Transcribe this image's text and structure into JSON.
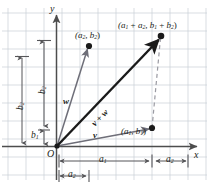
{
  "figure": {
    "type": "vector-addition-diagram",
    "axes": {
      "x_label": "x",
      "y_label": "y",
      "origin_label": "O"
    },
    "colors": {
      "grid": "#c9cfd6",
      "axis": "#4d4d4d",
      "vector_v": "#6e6e78",
      "vector_w": "#6e6e78",
      "vector_sum": "#1a1a1a",
      "dashed": "#9a9aa2",
      "measure": "#555558",
      "text": "#231f20",
      "background": "#ffffff"
    },
    "points": [
      {
        "name": "point-v",
        "label_a": "a",
        "label_a_sub": "1",
        "label_b": "b",
        "label_b_sub": "1",
        "text": "(a1, b1)"
      },
      {
        "name": "point-w",
        "label_a": "a",
        "label_a_sub": "2",
        "label_b": "b",
        "label_b_sub": "2",
        "text": "(a2, b2)"
      },
      {
        "name": "point-sum",
        "text": "(a1 + a2, b1 + b2)"
      }
    ],
    "labels": {
      "point_v": {
        "open": "(",
        "a": "a",
        "a_sub": "1",
        "comma": ", ",
        "b": "b",
        "b_sub": "1",
        "close": ")"
      },
      "point_w": {
        "open": "(",
        "a": "a",
        "a_sub": "2",
        "comma": ", ",
        "b": "b",
        "b_sub": "2",
        "close": ")"
      },
      "point_sum": {
        "open": "(",
        "a1": "a",
        "a1_sub": "1",
        "plus1": " + ",
        "a2": "a",
        "a2_sub": "2",
        "comma": ", ",
        "b1": "b",
        "b1_sub": "1",
        "plus2": " + ",
        "b2": "b",
        "b2_sub": "2",
        "close": ")"
      },
      "vector_v": "v",
      "vector_w": "w",
      "vector_sum": {
        "v": "v",
        "plus": " + ",
        "w": "w"
      }
    },
    "measurements": {
      "horizontal": [
        {
          "name": "a1-measure",
          "base": "a",
          "sub": "1"
        },
        {
          "name": "a2-measure-upper",
          "base": "a",
          "sub": "2"
        },
        {
          "name": "a2-measure-lower",
          "base": "a",
          "sub": "2"
        }
      ],
      "vertical": [
        {
          "name": "b2-measure-left",
          "base": "b",
          "sub": "2"
        },
        {
          "name": "b2-measure-inner",
          "base": "b",
          "sub": "2"
        },
        {
          "name": "b1-measure",
          "base": "b",
          "sub": "1"
        }
      ]
    }
  }
}
